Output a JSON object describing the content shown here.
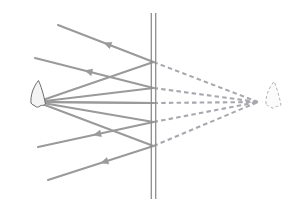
{
  "figure": {
    "canvas": {
      "width": 300,
      "height": 206,
      "background": "#ffffff"
    }
  },
  "colors": {
    "ray_solid": "#9a9a9a",
    "ray_dashed": "#a8a8ae",
    "mirror_line": "#8e8e8e",
    "object_outline": "#6b6b6b",
    "object_fill": "#f4f4f4",
    "image_outline": "#b3b3b3",
    "image_fill": "#fbfbfb",
    "background": "#ffffff"
  },
  "mirror": {
    "label": "plane-mirror",
    "x": 153.5,
    "y_top": 13,
    "y_bottom": 199,
    "line_offset": 2.2,
    "stroke_width": 1.3
  },
  "object": {
    "label": "object-candle-flame",
    "source_point": {
      "x": 37,
      "y": 102
    },
    "outline_path": "M 31 103 C 30.5 96 32.5 88 38.5 80.5 C 41 86 43.5 94 45.5 104 C 43.5 106.5 41.5 104.5 40 106 C 38.5 107.5 36.5 107.5 35 106 C 33.5 104.5 32.5 105.5 31 103 Z",
    "stroke_width": 1.0
  },
  "image": {
    "label": "virtual-image-candle-flame",
    "image_point": {
      "x": 258,
      "y": 102
    },
    "outline_path": "M 266 104 C 265.5 97 268 89 274 81.5 C 276.5 87 279 95 281 105 C 279 107.5 277 105.5 275.5 107 C 274 108.5 272 108.5 270.5 107 C 269 105.5 267.5 106.5 266 104 Z",
    "stroke_width": 1.0,
    "dash": "3 2.2"
  },
  "rays": {
    "stroke_width": 2.1,
    "arrow_size": 7.5,
    "incident": [
      {
        "name": "incident-ray-1",
        "from": {
          "x": 37,
          "y": 102
        },
        "to": {
          "x": 153.5,
          "y": 62
        }
      },
      {
        "name": "incident-ray-2",
        "from": {
          "x": 37,
          "y": 102
        },
        "to": {
          "x": 153.5,
          "y": 88
        }
      },
      {
        "name": "incident-ray-3",
        "from": {
          "x": 37,
          "y": 102
        },
        "to": {
          "x": 153.5,
          "y": 103
        }
      },
      {
        "name": "incident-ray-4",
        "from": {
          "x": 37,
          "y": 102
        },
        "to": {
          "x": 153.5,
          "y": 122
        }
      },
      {
        "name": "incident-ray-5",
        "from": {
          "x": 37,
          "y": 102
        },
        "to": {
          "x": 153.5,
          "y": 146
        }
      }
    ],
    "reflected": [
      {
        "name": "reflected-ray-1",
        "from": {
          "x": 153.5,
          "y": 62
        },
        "to": {
          "x": 58,
          "y": 25
        },
        "arrow_t": 0.52
      },
      {
        "name": "reflected-ray-2",
        "from": {
          "x": 153.5,
          "y": 88
        },
        "to": {
          "x": 35,
          "y": 58
        },
        "arrow_t": 0.58
      },
      {
        "name": "reflected-ray-3",
        "from": {
          "x": 153.5,
          "y": 103
        },
        "to": {
          "x": 37,
          "y": 102
        },
        "arrow_t": 0.99
      },
      {
        "name": "reflected-ray-4",
        "from": {
          "x": 153.5,
          "y": 122
        },
        "to": {
          "x": 38,
          "y": 147
        },
        "arrow_t": 0.52
      },
      {
        "name": "reflected-ray-5",
        "from": {
          "x": 153.5,
          "y": 146
        },
        "to": {
          "x": 48,
          "y": 180
        },
        "arrow_t": 0.5
      }
    ],
    "virtual_extensions": [
      {
        "name": "virtual-ray-1",
        "from": {
          "x": 153.5,
          "y": 62
        },
        "to": {
          "x": 258,
          "y": 102
        }
      },
      {
        "name": "virtual-ray-2",
        "from": {
          "x": 153.5,
          "y": 88
        },
        "to": {
          "x": 258,
          "y": 102
        }
      },
      {
        "name": "virtual-ray-3",
        "from": {
          "x": 153.5,
          "y": 103
        },
        "to": {
          "x": 258,
          "y": 102
        }
      },
      {
        "name": "virtual-ray-4",
        "from": {
          "x": 153.5,
          "y": 122
        },
        "to": {
          "x": 258,
          "y": 102
        }
      },
      {
        "name": "virtual-ray-5",
        "from": {
          "x": 153.5,
          "y": 146
        },
        "to": {
          "x": 258,
          "y": 102
        }
      }
    ],
    "dash_pattern": "4.5 3.2"
  }
}
